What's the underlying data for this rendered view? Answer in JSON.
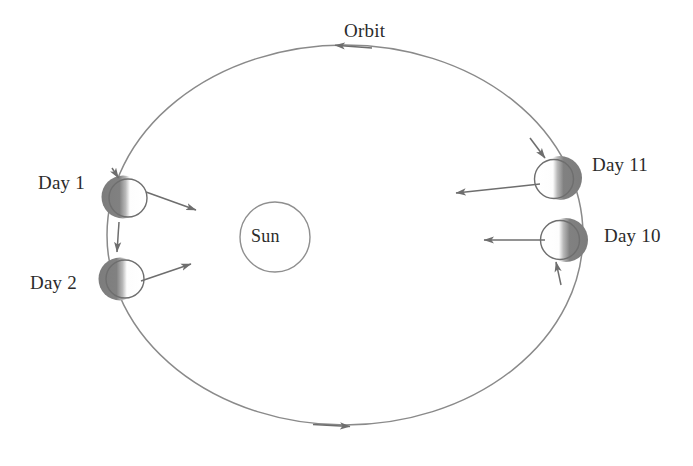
{
  "figure": {
    "kind": "orbit-diagram",
    "background_color": "#ffffff",
    "stroke_color": "#6e6e6e",
    "text_color": "#2b2b2b",
    "shadow_color": "#7a7a7a",
    "lit_color": "#ffffff"
  },
  "labels": {
    "orbit": "Orbit",
    "sun": "Sun",
    "day1": "Day 1",
    "day2": "Day 2",
    "day10": "Day 10",
    "day11": "Day 11"
  },
  "orbit": {
    "center_x": 345,
    "center_y": 235,
    "radius_x": 238,
    "radius_y": 190,
    "direction": "counterclockwise",
    "arrow_top": {
      "x": 348,
      "y": 46,
      "points": "left"
    },
    "arrow_bottom": {
      "x": 342,
      "y": 425,
      "points": "right"
    }
  },
  "sun": {
    "center_x": 275,
    "center_y": 237,
    "radius": 35
  },
  "planets": [
    {
      "id": "day1",
      "label": "Day 1",
      "center_x": 123,
      "center_y": 197,
      "radius": 21,
      "dark_side": "left",
      "label_x": 38,
      "label_y": 172,
      "arrow": {
        "x1": 146,
        "y1": 192,
        "x2": 197,
        "y2": 210
      }
    },
    {
      "id": "day2",
      "label": "Day 2",
      "center_x": 120,
      "center_y": 279,
      "radius": 21,
      "dark_side": "left",
      "label_x": 30,
      "label_y": 272,
      "arrow": {
        "x1": 141,
        "y1": 281,
        "x2": 192,
        "y2": 264
      }
    },
    {
      "id": "day11",
      "label": "Day 11",
      "center_x": 558,
      "center_y": 178,
      "radius": 22,
      "dark_side": "right",
      "label_x": 592,
      "label_y": 154,
      "arrow": {
        "x1": 540,
        "y1": 184,
        "x2": 454,
        "y2": 193
      }
    },
    {
      "id": "day10",
      "label": "Day 10",
      "center_x": 563,
      "center_y": 240,
      "radius": 22,
      "dark_side": "right",
      "label_x": 604,
      "label_y": 225,
      "arrow": {
        "x1": 545,
        "y1": 240,
        "x2": 482,
        "y2": 240
      }
    }
  ],
  "orbit_label_position": {
    "x": 344,
    "y": 20
  },
  "sun_label_position": {
    "x": 251,
    "y": 226
  }
}
